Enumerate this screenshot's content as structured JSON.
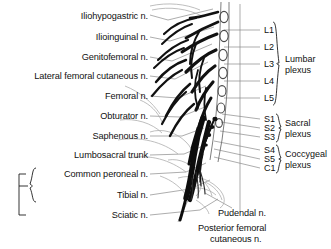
{
  "figure": {
    "background_color": "#ffffff",
    "text_color": "#111111",
    "nerve_color": "#111111",
    "outline_color": "#9a9a9a",
    "leader_color": "#8a8a8a"
  },
  "left_labels": [
    {
      "text": "Iliohypogastric n.",
      "x": 148,
      "y": 16
    },
    {
      "text": "Ilioinguinal n.",
      "x": 148,
      "y": 37
    },
    {
      "text": "Genitofemoral n.",
      "x": 148,
      "y": 57
    },
    {
      "text": "Lateral femoral cutaneous n.",
      "x": 148,
      "y": 76
    },
    {
      "text": "Femoral n.",
      "x": 148,
      "y": 96
    },
    {
      "text": "Obturator n.",
      "x": 148,
      "y": 116
    },
    {
      "text": "Saphenous n.",
      "x": 148,
      "y": 136
    },
    {
      "text": "Lumbosacral trunk",
      "x": 148,
      "y": 155
    },
    {
      "text": "Common peroneal n.",
      "x": 148,
      "y": 174
    },
    {
      "text": "Tibial n.",
      "x": 148,
      "y": 195
    },
    {
      "text": "Sciatic n.",
      "x": 148,
      "y": 215
    }
  ],
  "segment_labels": [
    {
      "text": "L1",
      "x": 264,
      "y": 30,
      "group": "lumbar"
    },
    {
      "text": "L2",
      "x": 264,
      "y": 47,
      "group": "lumbar"
    },
    {
      "text": "L3",
      "x": 264,
      "y": 64,
      "group": "lumbar"
    },
    {
      "text": "L4",
      "x": 264,
      "y": 81,
      "group": "lumbar"
    },
    {
      "text": "L5",
      "x": 264,
      "y": 98,
      "group": "lumbar"
    },
    {
      "text": "S1",
      "x": 264,
      "y": 119,
      "group": "sacral"
    },
    {
      "text": "S2",
      "x": 264,
      "y": 128,
      "group": "sacral"
    },
    {
      "text": "S3",
      "x": 264,
      "y": 137,
      "group": "sacral"
    },
    {
      "text": "S4",
      "x": 264,
      "y": 150,
      "group": "coccygeal"
    },
    {
      "text": "S5",
      "x": 264,
      "y": 159,
      "group": "coccygeal"
    },
    {
      "text": "C1",
      "x": 264,
      "y": 168,
      "group": "coccygeal"
    }
  ],
  "plexus_groups": [
    {
      "name": "lumbar",
      "line1": "Lumbar",
      "line2": "plexus",
      "x": 287,
      "y": 64
    },
    {
      "name": "sacral",
      "line1": "Sacral",
      "line2": "plexus",
      "x": 287,
      "y": 128
    },
    {
      "name": "coccygeal",
      "line1": "Coccygeal",
      "line2": "plexus",
      "x": 287,
      "y": 159
    }
  ],
  "bottom_labels": [
    {
      "text": "Pudendal n.",
      "x": 218,
      "y": 213
    },
    {
      "text": "Posterior femoral",
      "x": 198,
      "y": 228
    },
    {
      "text": "cutaneous n.",
      "x": 210,
      "y": 239
    }
  ],
  "bracket_group": {
    "outer_label": "Sciatic n.",
    "inner_labels": [
      "Common peroneal n.",
      "Tibial n."
    ]
  }
}
